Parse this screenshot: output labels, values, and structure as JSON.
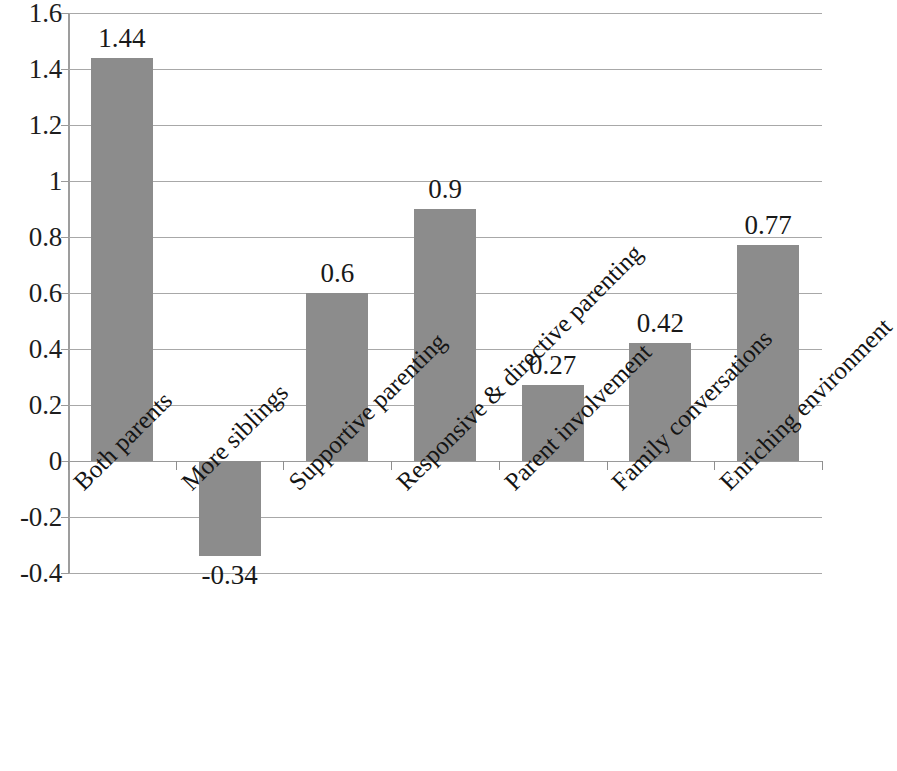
{
  "chart_data": {
    "type": "bar",
    "title": "",
    "subtitle": "",
    "xlabel": "",
    "ylabel": "",
    "ylim": [
      -0.4,
      1.6
    ],
    "ytick_step": 0.2,
    "grid": true,
    "legend": false,
    "orientation": "vertical",
    "bar_color": "#8c8c8c",
    "categories": [
      "Both parents",
      "More siblings",
      "Supportive parenting",
      "Responsive & directive parenting",
      "Parent involvement",
      "Family conversations",
      "Enriching environment"
    ],
    "values": [
      1.44,
      -0.34,
      0.6,
      0.9,
      0.27,
      0.42,
      0.77
    ],
    "data_labels": [
      "1.44",
      "-0.34",
      "0.6",
      "0.9",
      "0.27",
      "0.42",
      "0.77"
    ],
    "ytick_labels": [
      "1.6",
      "1.4",
      "1.2",
      "1",
      "0.8",
      "0.6",
      "0.4",
      "0.2",
      "0",
      "-0.2",
      "-0.4"
    ],
    "ytick_values": [
      1.6,
      1.4,
      1.2,
      1,
      0.8,
      0.6,
      0.4,
      0.2,
      0,
      -0.2,
      -0.4
    ]
  }
}
